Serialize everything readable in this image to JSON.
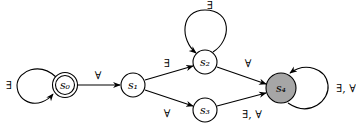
{
  "diagram": {
    "type": "state-automaton",
    "nodes": [
      {
        "id": "s0",
        "label": "s₀",
        "kind": "initial-accepting"
      },
      {
        "id": "s1",
        "label": "s₁",
        "kind": "normal"
      },
      {
        "id": "s2",
        "label": "s₂",
        "kind": "normal"
      },
      {
        "id": "s3",
        "label": "s₃",
        "kind": "normal"
      },
      {
        "id": "s4",
        "label": "s₄",
        "kind": "filled"
      }
    ],
    "edges": [
      {
        "from": "s0",
        "to": "s0",
        "label": "∃"
      },
      {
        "from": "s0",
        "to": "s1",
        "label": "∀"
      },
      {
        "from": "s1",
        "to": "s2",
        "label": "∃"
      },
      {
        "from": "s1",
        "to": "s3",
        "label": "∀"
      },
      {
        "from": "s2",
        "to": "s2",
        "label": "∃"
      },
      {
        "from": "s2",
        "to": "s4",
        "label": "∀"
      },
      {
        "from": "s3",
        "to": "s4",
        "label": "∃, ∀"
      },
      {
        "from": "s4",
        "to": "s4",
        "label": "∃, ∀"
      }
    ],
    "colors": {
      "filled_node": "#a6a6a6",
      "stroke": "#000000"
    }
  }
}
